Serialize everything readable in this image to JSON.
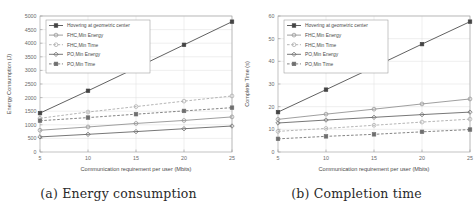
{
  "figure": {
    "panels": [
      {
        "id": "panel-a",
        "caption": "(a) Energy consumption",
        "xlabel": "Communication requirement per user (Mbits)",
        "ylabel": "Energy Consumption (J)"
      },
      {
        "id": "panel-b",
        "caption": "(b) Completion time",
        "xlabel": "Communication requirement per user (Mbits)",
        "ylabel": "Complete Time (s)"
      }
    ]
  },
  "legend": {
    "entries": [
      {
        "label": "Hovering at geometric center",
        "marker": "square",
        "style": "solid",
        "color": "#444444"
      },
      {
        "label": "FHC,Min Energy",
        "marker": "circle",
        "style": "solid",
        "color": "#8e8e8e"
      },
      {
        "label": "FHC,Min Time",
        "marker": "circle",
        "style": "dashed",
        "color": "#a8a8a8"
      },
      {
        "label": "PO,Min Energy",
        "marker": "diamond",
        "style": "solid",
        "color": "#5e5e5e"
      },
      {
        "label": "PO,Min Time",
        "marker": "square",
        "style": "dashed",
        "color": "#6e6e6e"
      }
    ]
  },
  "chart_data": [
    {
      "type": "line",
      "title": "(a) Energy consumption",
      "xlabel": "Communication requirement per user (Mbits)",
      "ylabel": "Energy Consumption (J)",
      "x": [
        5,
        10,
        15,
        20,
        25
      ],
      "xlim": [
        5,
        25
      ],
      "ylim": [
        0,
        5000
      ],
      "xticks": [
        5,
        10,
        15,
        20,
        25
      ],
      "yticks": [
        0,
        500,
        1000,
        1500,
        2000,
        2500,
        3000,
        3500,
        4000,
        4500,
        5000
      ],
      "grid": true,
      "legend_position": "upper left",
      "series": [
        {
          "name": "Hovering at geometric center",
          "values": [
            1430,
            2250,
            3090,
            3940,
            4790
          ]
        },
        {
          "name": "FHC,Min Energy",
          "values": [
            800,
            920,
            1050,
            1160,
            1290
          ]
        },
        {
          "name": "FHC,Min Time",
          "values": [
            1240,
            1470,
            1670,
            1870,
            2060
          ]
        },
        {
          "name": "PO,Min Energy",
          "values": [
            555,
            650,
            750,
            855,
            955
          ]
        },
        {
          "name": "PO,Min Time",
          "values": [
            1150,
            1265,
            1390,
            1510,
            1630
          ]
        }
      ]
    },
    {
      "type": "line",
      "title": "(b) Completion time",
      "xlabel": "Communication requirement per user (Mbits)",
      "ylabel": "Complete Time (s)",
      "x": [
        5,
        10,
        15,
        20,
        25
      ],
      "xlim": [
        5,
        25
      ],
      "ylim": [
        0,
        60
      ],
      "xticks": [
        5,
        10,
        15,
        20,
        25
      ],
      "yticks": [
        0,
        10,
        20,
        30,
        40,
        50,
        60
      ],
      "grid": true,
      "legend_position": "upper left",
      "series": [
        {
          "name": "Hovering at geometric center",
          "values": [
            17.6,
            27.5,
            37.5,
            47.6,
            57.5
          ]
        },
        {
          "name": "FHC,Min Energy",
          "values": [
            14.4,
            16.7,
            18.9,
            21.2,
            23.4
          ]
        },
        {
          "name": "FHC,Min Time",
          "values": [
            9.1,
            10.4,
            11.8,
            13.2,
            14.5
          ]
        },
        {
          "name": "PO,Min Energy",
          "values": [
            12.8,
            14.1,
            15.3,
            16.5,
            17.6
          ]
        },
        {
          "name": "PO,Min Time",
          "values": [
            5.8,
            6.9,
            7.8,
            8.9,
            9.9
          ]
        }
      ]
    }
  ]
}
